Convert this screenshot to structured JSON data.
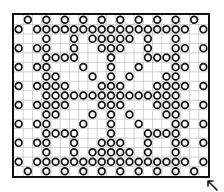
{
  "chart": {
    "cols": 21,
    "rows": 17,
    "line_color": "#b5b5b5",
    "border_color": "#111111",
    "circle_color": "#111111",
    "pattern": [
      [
        1,
        3,
        5,
        7,
        9,
        11,
        13,
        15,
        17,
        19
      ],
      [
        0,
        2,
        3,
        4,
        5,
        6,
        7,
        8,
        9,
        10,
        11,
        12,
        13,
        14,
        15,
        16,
        17,
        18,
        20
      ],
      [
        3,
        6,
        8,
        9,
        10,
        11,
        12,
        14,
        17
      ],
      [
        0,
        2,
        3,
        6,
        9,
        10,
        11,
        14,
        17,
        18,
        20
      ],
      [
        3,
        4,
        5,
        6,
        10,
        14,
        15,
        16,
        17
      ],
      [
        0,
        2,
        3,
        7,
        10,
        13,
        17,
        18,
        20
      ],
      [
        3,
        4,
        8,
        10,
        12,
        16,
        17
      ],
      [
        0,
        2,
        3,
        4,
        5,
        9,
        10,
        11,
        15,
        16,
        17,
        18,
        20
      ],
      [
        3,
        4,
        5,
        6,
        7,
        8,
        9,
        10,
        11,
        12,
        13,
        14,
        15,
        16,
        17
      ],
      [
        0,
        2,
        3,
        4,
        5,
        9,
        10,
        11,
        15,
        16,
        17,
        18,
        20
      ],
      [
        3,
        4,
        8,
        10,
        12,
        16,
        17
      ],
      [
        0,
        2,
        3,
        7,
        10,
        13,
        17,
        18,
        20
      ],
      [
        3,
        4,
        5,
        6,
        10,
        14,
        15,
        16,
        17
      ],
      [
        0,
        2,
        3,
        6,
        9,
        10,
        11,
        14,
        17,
        18,
        20
      ],
      [
        3,
        6,
        8,
        9,
        10,
        11,
        12,
        14,
        17
      ],
      [
        0,
        2,
        3,
        4,
        5,
        6,
        7,
        8,
        9,
        10,
        11,
        12,
        13,
        14,
        15,
        16,
        17,
        18,
        20
      ],
      [
        1,
        3,
        5,
        7,
        9,
        11,
        13,
        15,
        17,
        19
      ]
    ],
    "symbol": "open-circle"
  },
  "corner_marker": {
    "icon": "arrow-up-left-icon"
  }
}
